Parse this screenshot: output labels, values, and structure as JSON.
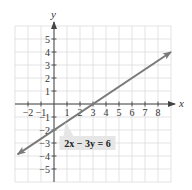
{
  "chart_data": {
    "type": "line",
    "title": "",
    "xlabel": "x",
    "ylabel": "y",
    "xlim": [
      -3,
      9
    ],
    "ylim": [
      -6,
      6
    ],
    "grid": true,
    "x_ticks": [
      -2,
      -1,
      1,
      2,
      3,
      4,
      5,
      6,
      7,
      8
    ],
    "y_ticks": [
      5,
      4,
      3,
      2,
      1,
      -1,
      -2,
      -3,
      -4,
      -5
    ],
    "x_tick_labels": [
      "−2",
      "−1",
      "1",
      "2",
      "3",
      "4",
      "5",
      "6",
      "7",
      "8"
    ],
    "y_tick_labels": [
      "5",
      "4",
      "3",
      "2",
      "1",
      "−1",
      "−2",
      "−3",
      "−4",
      "−5"
    ],
    "series": [
      {
        "name": "2x − 3y = 6",
        "equation": "2x − 3y = 6",
        "x": [
          -2.8,
          0,
          3,
          9
        ],
        "y": [
          -3.87,
          -2,
          0,
          4
        ],
        "color": "#7a7a7a",
        "arrows": "both"
      }
    ],
    "annotations": [
      {
        "text": "2x − 3y = 6",
        "x": 0.5,
        "y": -3
      }
    ]
  },
  "labels": {
    "x_axis": "x",
    "y_axis": "y",
    "equation": "2x − 3y = 6"
  },
  "colors": {
    "grid": "#dcdcdc",
    "axis": "#444444",
    "line": "#7a7a7a",
    "label_box": "#e6e6e6"
  }
}
